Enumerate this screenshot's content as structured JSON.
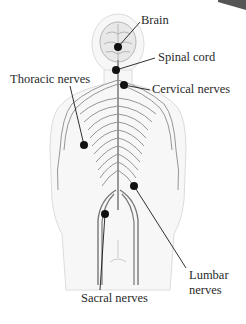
{
  "diagram": {
    "colors": {
      "background": "#ffffff",
      "body_outline": "#d9d9d9",
      "body_fill": "#f6f6f6",
      "nerve": "#7a7a7a",
      "marker": "#111111",
      "label_text": "#2a2a2a"
    },
    "labels": [
      {
        "id": "brain",
        "text": "Brain",
        "x": 141,
        "y": 13
      },
      {
        "id": "spinal-cord",
        "text": "Spinal cord",
        "x": 158,
        "y": 50
      },
      {
        "id": "cervical-nerves",
        "text": "Cervical nerves",
        "x": 152,
        "y": 82
      },
      {
        "id": "thoracic-nerves",
        "text": "Thoracic nerves",
        "x": 10,
        "y": 72
      },
      {
        "id": "lumbar-nerves-1",
        "text": "Lumbar",
        "x": 189,
        "y": 268
      },
      {
        "id": "lumbar-nerves-2",
        "text": "nerves",
        "x": 189,
        "y": 283
      },
      {
        "id": "sacral-nerves",
        "text": "Sacral nerves",
        "x": 81,
        "y": 291
      }
    ]
  }
}
